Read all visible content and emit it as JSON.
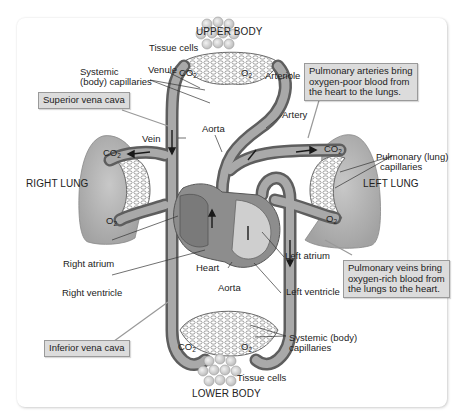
{
  "regions": {
    "upper_body": "UPPER BODY",
    "lower_body": "LOWER BODY",
    "right_lung": "RIGHT LUNG",
    "left_lung": "LEFT LUNG"
  },
  "labels": {
    "tissue_cells_top": "Tissue cells",
    "tissue_cells_bottom": "Tissue cells",
    "systemic_capillaries_top_line1": "Systemic",
    "systemic_capillaries_top_line2": "(body) capillaries",
    "systemic_capillaries_bottom_line1": "Systemic (body)",
    "systemic_capillaries_bottom_line2": "capillaries",
    "venule": "Venule",
    "arteriole": "Arteriole",
    "artery": "Artery",
    "vein": "Vein",
    "aorta_top": "Aorta",
    "aorta_bottom": "Aorta",
    "pulmonary_capillaries_line1": "Pulmonary (lung)",
    "pulmonary_capillaries_line2": "capillaries",
    "right_atrium": "Right atrium",
    "right_ventricle": "Right ventricle",
    "left_atrium": "Left atrium",
    "left_ventricle": "Left ventricle",
    "heart": "Heart"
  },
  "gases": {
    "co2": "CO",
    "co2_sub": "2",
    "o2": "O",
    "o2_sub": "2"
  },
  "callouts": {
    "superior_vena_cava": "Superior vena cava",
    "inferior_vena_cava": "Inferior vena cava",
    "pulmonary_arteries_line1": "Pulmonary arteries bring",
    "pulmonary_arteries_line2": "oxygen-poor blood from",
    "pulmonary_arteries_line3": "the heart to the lungs.",
    "pulmonary_veins_line1": "Pulmonary veins bring",
    "pulmonary_veins_line2": "oxygen-rich blood from",
    "pulmonary_veins_line3": "the lungs to the heart."
  },
  "colors": {
    "frame_bg": "#ffffff",
    "callout_bg": "#dcdcdc",
    "vessel_dark": "#6e6e6e",
    "vessel_light": "#a8a8a8",
    "lung_fill": "#b9b9b9",
    "heart_fill": "#8a8a8a"
  }
}
